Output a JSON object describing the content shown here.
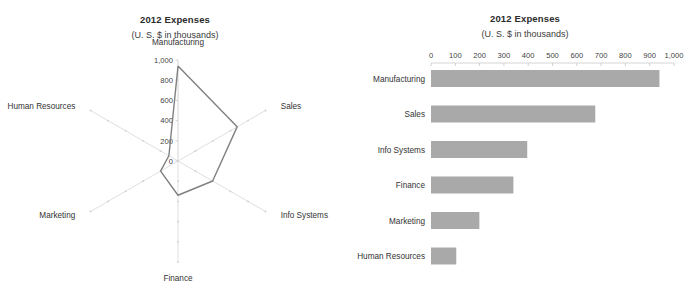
{
  "radar_panel": {
    "title": "2012 Expenses",
    "subtitle": "(U. S. $ in thousands)"
  },
  "bar_panel": {
    "title": "2012 Expenses",
    "subtitle": "(U. S. $ in thousands)"
  },
  "footnote": "",
  "colors": {
    "bar_fill": "#a9a9a9",
    "series_line": "#808080",
    "grid": "#d7d7d7",
    "text": "#333333"
  },
  "chart_data": [
    {
      "type": "line",
      "variant": "radar",
      "title": "2012 Expenses",
      "subtitle": "(U. S. $ in thousands)",
      "xlabel": "",
      "ylabel": "",
      "categories": [
        "Manufacturing",
        "Sales",
        "Info Systems",
        "Finance",
        "Marketing",
        "Human Resources"
      ],
      "values": [
        940,
        676,
        396,
        339,
        199,
        104
      ],
      "tick_labels": [
        "0",
        "200",
        "400",
        "600",
        "800",
        "1,000"
      ],
      "ticks": [
        0,
        200,
        400,
        600,
        800,
        1000
      ],
      "ylim": [
        0,
        1000
      ],
      "grid": true,
      "legend": "none"
    },
    {
      "type": "bar",
      "variant": "horizontal-bar",
      "title": "2012 Expenses",
      "subtitle": "(U. S. $ in thousands)",
      "xlabel": "",
      "ylabel": "",
      "categories": [
        "Manufacturing",
        "Sales",
        "Info Systems",
        "Finance",
        "Marketing",
        "Human Resources"
      ],
      "values": [
        940,
        676,
        396,
        339,
        199,
        104
      ],
      "tick_labels": [
        "0",
        "100",
        "200",
        "300",
        "400",
        "500",
        "600",
        "700",
        "800",
        "900",
        "1,000"
      ],
      "ticks": [
        0,
        100,
        200,
        300,
        400,
        500,
        600,
        700,
        800,
        900,
        1000
      ],
      "xlim": [
        0,
        1000
      ],
      "grid": false,
      "legend": "none"
    }
  ]
}
